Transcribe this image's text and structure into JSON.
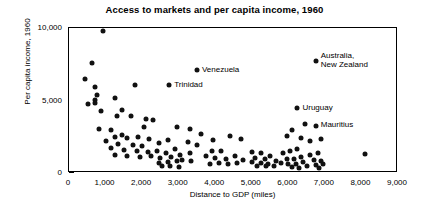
{
  "chart_data": {
    "type": "scatter",
    "title": "Access to markets and per capita income, 1960",
    "xlabel": "Distance to GDP (miles)",
    "ylabel": "Per capita income, 1960",
    "xlim": [
      0,
      9000
    ],
    "ylim": [
      0,
      10000
    ],
    "xticks": [
      0,
      1000,
      2000,
      3000,
      4000,
      5000,
      6000,
      7000,
      8000,
      9000
    ],
    "xtick_labels": [
      "0",
      "1,000",
      "2,000",
      "3,000",
      "4,000",
      "5,000",
      "6,000",
      "7,000",
      "8,000",
      "9,000"
    ],
    "yticks": [
      0,
      5000,
      10000
    ],
    "ytick_labels": [
      "0",
      "5,000",
      "10,000"
    ],
    "grid": false,
    "legend": null,
    "marker_color": "#111111",
    "points": [
      [
        930,
        9800
      ],
      [
        640,
        7600
      ],
      [
        430,
        6500
      ],
      [
        700,
        5950
      ],
      [
        760,
        5350
      ],
      [
        720,
        5050
      ],
      [
        700,
        4850
      ],
      [
        520,
        4750
      ],
      [
        1250,
        5200
      ],
      [
        1800,
        6100
      ],
      [
        1300,
        3950
      ],
      [
        1700,
        3900
      ],
      [
        2100,
        3700
      ],
      [
        2300,
        3650
      ],
      [
        2740,
        6050
      ],
      [
        3500,
        7100
      ],
      [
        6750,
        7750
      ],
      [
        830,
        3050
      ],
      [
        1150,
        2950
      ],
      [
        1450,
        2600
      ],
      [
        1250,
        2450
      ],
      [
        1600,
        2400
      ],
      [
        1900,
        2500
      ],
      [
        2200,
        2350
      ],
      [
        1000,
        2200
      ],
      [
        1350,
        2000
      ],
      [
        1750,
        1950
      ],
      [
        2000,
        1850
      ],
      [
        2450,
        2100
      ],
      [
        2700,
        2250
      ],
      [
        1150,
        1750
      ],
      [
        1500,
        1600
      ],
      [
        1850,
        1500
      ],
      [
        2150,
        1450
      ],
      [
        2400,
        1550
      ],
      [
        2650,
        1400
      ],
      [
        2900,
        1650
      ],
      [
        1250,
        1250
      ],
      [
        1600,
        1150
      ],
      [
        1950,
        1100
      ],
      [
        2250,
        1200
      ],
      [
        2500,
        1050
      ],
      [
        2800,
        1100
      ],
      [
        3050,
        1250
      ],
      [
        3300,
        1400
      ],
      [
        3100,
        900
      ],
      [
        3350,
        850
      ],
      [
        2950,
        800
      ],
      [
        2700,
        750
      ],
      [
        2450,
        700
      ],
      [
        3600,
        2700
      ],
      [
        3900,
        1550
      ],
      [
        4150,
        1500
      ],
      [
        3750,
        1150
      ],
      [
        4000,
        1050
      ],
      [
        4300,
        1000
      ],
      [
        4550,
        1150
      ],
      [
        4100,
        700
      ],
      [
        4350,
        650
      ],
      [
        4600,
        700
      ],
      [
        3850,
        600
      ],
      [
        4750,
        900
      ],
      [
        5000,
        1450
      ],
      [
        5250,
        1400
      ],
      [
        5100,
        1050
      ],
      [
        5350,
        1000
      ],
      [
        5500,
        1200
      ],
      [
        5000,
        750
      ],
      [
        5250,
        700
      ],
      [
        5450,
        650
      ],
      [
        5650,
        800
      ],
      [
        5150,
        500
      ],
      [
        5400,
        450
      ],
      [
        5600,
        500
      ],
      [
        5850,
        1350
      ],
      [
        6050,
        1500
      ],
      [
        6250,
        1650
      ],
      [
        5950,
        1000
      ],
      [
        6150,
        950
      ],
      [
        6350,
        1100
      ],
      [
        5800,
        700
      ],
      [
        6000,
        600
      ],
      [
        6200,
        650
      ],
      [
        6400,
        750
      ],
      [
        6100,
        400
      ],
      [
        6300,
        350
      ],
      [
        6500,
        450
      ],
      [
        6600,
        1250
      ],
      [
        6800,
        1400
      ],
      [
        6700,
        900
      ],
      [
        6900,
        800
      ],
      [
        6750,
        550
      ],
      [
        6950,
        600
      ],
      [
        6850,
        350
      ],
      [
        6250,
        4450
      ],
      [
        6750,
        3250
      ],
      [
        6450,
        3400
      ],
      [
        6100,
        3000
      ],
      [
        5950,
        2550
      ],
      [
        6350,
        2400
      ],
      [
        6600,
        2200
      ],
      [
        6900,
        2350
      ],
      [
        8100,
        1300
      ],
      [
        4400,
        2550
      ],
      [
        4700,
        2350
      ],
      [
        3950,
        2300
      ],
      [
        3500,
        1950
      ],
      [
        3250,
        2150
      ],
      [
        2950,
        3150
      ],
      [
        3300,
        3050
      ],
      [
        2050,
        3200
      ],
      [
        1450,
        4350
      ],
      [
        870,
        4300
      ],
      [
        2550,
        500
      ],
      [
        2750,
        450
      ],
      [
        3000,
        400
      ]
    ],
    "annotations": [
      {
        "label": "Venezuela",
        "x": 3500,
        "y": 7100
      },
      {
        "label": "Trinidad",
        "x": 2740,
        "y": 6050
      },
      {
        "label": "Australia,\nNew Zealand",
        "x": 6750,
        "y": 7750
      },
      {
        "label": "Uruguay",
        "x": 6250,
        "y": 4450
      },
      {
        "label": "Mauritius",
        "x": 6750,
        "y": 3250
      }
    ]
  }
}
